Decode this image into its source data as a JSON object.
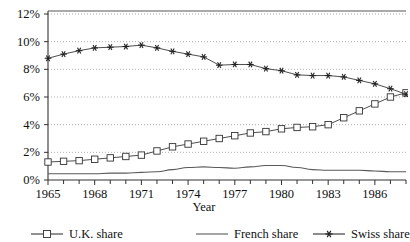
{
  "title_fragment": "",
  "axis": {
    "x_title": "Year",
    "y_ticks": [
      "0%",
      "2%",
      "4%",
      "6%",
      "8%",
      "10%",
      "12%"
    ],
    "x_ticks": [
      "1965",
      "1968",
      "1971",
      "1974",
      "1977",
      "1980",
      "1983",
      "1986"
    ]
  },
  "legend": {
    "items": [
      {
        "label": "U.K. share",
        "marker": "square",
        "color": "#3a3a3a"
      },
      {
        "label": "French share",
        "marker": "none",
        "color": "#5a5a5a"
      },
      {
        "label": "Swiss share",
        "marker": "star",
        "color": "#2e2e2e"
      }
    ]
  },
  "chart_data": {
    "type": "line",
    "title": "",
    "xlabel": "Year",
    "ylabel": "",
    "xlim": [
      1965,
      1988
    ],
    "ylim": [
      0,
      12
    ],
    "ytick_values": [
      0,
      2,
      4,
      6,
      8,
      10,
      12
    ],
    "ytick_labels": [
      "0%",
      "2%",
      "4%",
      "6%",
      "8%",
      "10%",
      "12%"
    ],
    "xtick_values": [
      1965,
      1966,
      1967,
      1968,
      1969,
      1970,
      1971,
      1972,
      1973,
      1974,
      1975,
      1976,
      1977,
      1978,
      1979,
      1980,
      1981,
      1982,
      1983,
      1984,
      1985,
      1986,
      1987,
      1988
    ],
    "xtick_labeled": [
      1965,
      1968,
      1971,
      1974,
      1977,
      1980,
      1983,
      1986
    ],
    "grid": "horizontal-dotted",
    "legend_position": "bottom",
    "x": [
      1965,
      1966,
      1967,
      1968,
      1969,
      1970,
      1971,
      1972,
      1973,
      1974,
      1975,
      1976,
      1977,
      1978,
      1979,
      1980,
      1981,
      1982,
      1983,
      1984,
      1985,
      1986,
      1987,
      1988
    ],
    "series": [
      {
        "name": "U.K. share",
        "marker": "square",
        "values": [
          1.3,
          1.35,
          1.4,
          1.5,
          1.6,
          1.7,
          1.8,
          2.1,
          2.4,
          2.6,
          2.8,
          3.0,
          3.2,
          3.4,
          3.5,
          3.7,
          3.8,
          3.85,
          4.0,
          4.5,
          5.0,
          5.5,
          6.0,
          6.3
        ]
      },
      {
        "name": "French share",
        "marker": "none",
        "values": [
          0.45,
          0.45,
          0.45,
          0.45,
          0.5,
          0.5,
          0.55,
          0.6,
          0.75,
          0.9,
          0.95,
          0.9,
          0.85,
          0.95,
          1.05,
          1.05,
          0.9,
          0.75,
          0.7,
          0.7,
          0.7,
          0.65,
          0.6,
          0.6
        ]
      },
      {
        "name": "Swiss share",
        "marker": "star",
        "values": [
          8.8,
          9.1,
          9.35,
          9.55,
          9.6,
          9.65,
          9.75,
          9.55,
          9.3,
          9.1,
          8.9,
          8.3,
          8.35,
          8.35,
          8.05,
          7.9,
          7.6,
          7.55,
          7.55,
          7.45,
          7.2,
          6.95,
          6.6,
          6.2
        ]
      }
    ]
  }
}
